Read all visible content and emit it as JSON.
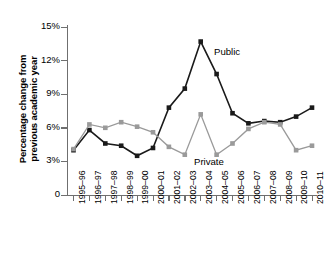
{
  "axes": {
    "y_title": "Percentage change from\nprevious academic year",
    "y_ticks": [
      "15%",
      "12%",
      "9%",
      "6%",
      "3%",
      "0"
    ],
    "x_ticks": [
      "1995–96",
      "1996–97",
      "1997–98",
      "1998–99",
      "1999–00",
      "2000–01",
      "2001–02",
      "2002–03",
      "2003–04",
      "2004–05",
      "2005–06",
      "2006–07",
      "2007–08",
      "2008–09",
      "2009–10",
      "2010–11"
    ]
  },
  "legend": {
    "public_label": "Public",
    "private_label": "Private"
  },
  "colors": {
    "public": "#1a1a1a",
    "private": "#9a9a9a",
    "axis": "#6f6f6f",
    "background": "#ffffff"
  },
  "chart_data": {
    "type": "line",
    "title": "",
    "xlabel": "",
    "ylabel": "Percentage change from previous academic year",
    "ylim": [
      0,
      15
    ],
    "yticks": [
      0,
      3,
      6,
      9,
      12,
      15
    ],
    "grid": false,
    "legend_position": "inline-annotation",
    "categories": [
      "1995–96",
      "1996–97",
      "1997–98",
      "1998–99",
      "1999–00",
      "2000–01",
      "2001–02",
      "2002–03",
      "2003–04",
      "2004–05",
      "2005–06",
      "2006–07",
      "2007–08",
      "2008–09",
      "2009–10",
      "2010–11"
    ],
    "series": [
      {
        "name": "Public",
        "color": "#1a1a1a",
        "marker": "square",
        "values": [
          4.0,
          5.8,
          4.6,
          4.4,
          3.5,
          4.2,
          7.8,
          9.5,
          13.7,
          10.8,
          7.3,
          6.4,
          6.6,
          6.5,
          7.0,
          7.8
        ]
      },
      {
        "name": "Private",
        "color": "#9a9a9a",
        "marker": "square",
        "values": [
          4.1,
          6.3,
          6.0,
          6.5,
          6.1,
          5.6,
          4.3,
          3.6,
          7.2,
          3.6,
          4.6,
          5.9,
          6.5,
          6.3,
          4.0,
          4.4
        ]
      }
    ]
  }
}
